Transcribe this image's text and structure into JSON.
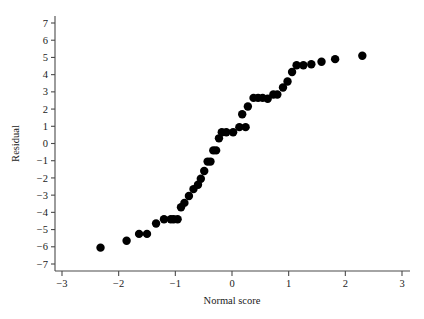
{
  "chart_data": {
    "type": "scatter",
    "title": "",
    "xlabel": "Normal score",
    "ylabel": "Residual",
    "xlim": [
      -3.35,
      3.2
    ],
    "ylim": [
      -7.5,
      7.5
    ],
    "xticks": [
      -3,
      -2,
      -1,
      0,
      1,
      2,
      3
    ],
    "xticklabels": [
      "−3",
      "−2",
      "−1",
      "0",
      "1",
      "2",
      "3"
    ],
    "yticks": [
      -7,
      -6,
      -5,
      -4,
      -3,
      -2,
      -1,
      0,
      1,
      2,
      3,
      4,
      5,
      6,
      7
    ],
    "yticklabels": [
      "−7",
      "−6",
      "−5",
      "−4",
      "−3",
      "−2",
      "−1",
      "0",
      "1",
      "2",
      "3",
      "4",
      "5",
      "6",
      "7"
    ],
    "grid": false,
    "legend": null,
    "marker": "filled-circle",
    "marker_color": "#000000",
    "marker_size": 4.2,
    "points": [
      {
        "x": -2.32,
        "y": -6.05
      },
      {
        "x": -1.86,
        "y": -5.65
      },
      {
        "x": -1.64,
        "y": -5.25
      },
      {
        "x": -1.5,
        "y": -5.25
      },
      {
        "x": -1.34,
        "y": -4.65
      },
      {
        "x": -1.2,
        "y": -4.4
      },
      {
        "x": -1.08,
        "y": -4.4
      },
      {
        "x": -1.03,
        "y": -4.4
      },
      {
        "x": -0.96,
        "y": -4.4
      },
      {
        "x": -0.9,
        "y": -3.7
      },
      {
        "x": -0.84,
        "y": -3.45
      },
      {
        "x": -0.76,
        "y": -3.05
      },
      {
        "x": -0.68,
        "y": -2.65
      },
      {
        "x": -0.6,
        "y": -2.4
      },
      {
        "x": -0.55,
        "y": -2.05
      },
      {
        "x": -0.49,
        "y": -1.6
      },
      {
        "x": -0.43,
        "y": -1.05
      },
      {
        "x": -0.38,
        "y": -1.05
      },
      {
        "x": -0.33,
        "y": -0.4
      },
      {
        "x": -0.28,
        "y": -0.4
      },
      {
        "x": -0.23,
        "y": 0.3
      },
      {
        "x": -0.18,
        "y": 0.65
      },
      {
        "x": -0.1,
        "y": 0.65
      },
      {
        "x": 0.02,
        "y": 0.65
      },
      {
        "x": 0.13,
        "y": 0.95
      },
      {
        "x": 0.18,
        "y": 1.7
      },
      {
        "x": 0.24,
        "y": 0.95
      },
      {
        "x": 0.28,
        "y": 2.15
      },
      {
        "x": 0.38,
        "y": 2.65
      },
      {
        "x": 0.46,
        "y": 2.65
      },
      {
        "x": 0.54,
        "y": 2.65
      },
      {
        "x": 0.63,
        "y": 2.6
      },
      {
        "x": 0.73,
        "y": 2.85
      },
      {
        "x": 0.8,
        "y": 2.85
      },
      {
        "x": 0.9,
        "y": 3.25
      },
      {
        "x": 0.98,
        "y": 3.6
      },
      {
        "x": 1.06,
        "y": 4.15
      },
      {
        "x": 1.14,
        "y": 4.55
      },
      {
        "x": 1.26,
        "y": 4.55
      },
      {
        "x": 1.4,
        "y": 4.6
      },
      {
        "x": 1.58,
        "y": 4.75
      },
      {
        "x": 1.82,
        "y": 4.9
      },
      {
        "x": 2.3,
        "y": 5.1
      }
    ]
  },
  "colors": {
    "axis": "#4a4a4a",
    "text": "#1a1a1a",
    "marker": "#000000",
    "background": "#ffffff"
  }
}
